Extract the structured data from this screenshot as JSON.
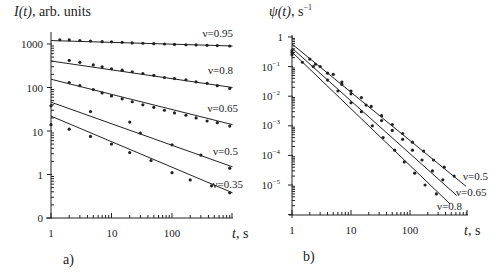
{
  "chart_data": [
    {
      "type": "line",
      "panel_label": "a)",
      "title": "",
      "ylabel": "I(t), arb. units",
      "xlabel": "t, s",
      "xscale": "log",
      "yscale": "log",
      "xlim": [
        1,
        1000
      ],
      "ylim": [
        0.1,
        2000
      ],
      "x_ticks": [
        1,
        10,
        100
      ],
      "x_tick_labels": [
        "1",
        "10",
        "100"
      ],
      "y_ticks": [
        1000,
        100,
        10,
        1,
        0.1
      ],
      "y_tick_labels": [
        "1000",
        "100",
        "10",
        "1",
        "0"
      ],
      "grid": false,
      "legend": "inline labels at right end of each line",
      "series": [
        {
          "name": "v=0.95",
          "label": "ν=0.95",
          "fit": {
            "t": [
              1,
              1000
            ],
            "y": [
              1200,
              900
            ]
          },
          "points": {
            "t": [
              1.4,
              2,
              3,
              4.5,
              7,
              10,
              15,
              22,
              33,
              50,
              75,
              110,
              170,
              250,
              380,
              560,
              900
            ],
            "y": [
              1250,
              1240,
              1200,
              1170,
              1130,
              1120,
              1090,
              1060,
              1040,
              1020,
              1000,
              980,
              960,
              950,
              930,
              920,
              900
            ]
          }
        },
        {
          "name": "v=0.8",
          "label": "ν=0.8",
          "fit": {
            "t": [
              1,
              1000
            ],
            "y": [
              406,
              100
            ]
          },
          "points": {
            "t": [
              2,
              3,
              5,
              7,
              10,
              15,
              22,
              33,
              50,
              75,
              110,
              170,
              250,
              380,
              560,
              900
            ],
            "y": [
              420,
              380,
              330,
              300,
              270,
              250,
              230,
              210,
              190,
              170,
              160,
              150,
              135,
              125,
              110,
              95
            ]
          }
        },
        {
          "name": "v=0.65",
          "label": "ν=0.65",
          "fit": {
            "t": [
              1,
              1000
            ],
            "y": [
              155,
              14
            ]
          },
          "points": {
            "t": [
              2,
              3,
              5,
              7,
              10,
              15,
              22,
              33,
              50,
              75,
              110,
              170,
              250,
              380,
              560,
              900
            ],
            "y": [
              130,
              110,
              90,
              75,
              64,
              55,
              47,
              40,
              35,
              30,
              26,
              23,
              20,
              17,
              15.5,
              13
            ]
          }
        },
        {
          "name": "v=0.5",
          "label": "ν=0.5",
          "fit": {
            "t": [
              1,
              1000
            ],
            "y": [
              46,
              1.5
            ]
          },
          "points": {
            "t": [
              1,
              4.5,
              20,
              30,
              100,
              300,
              900
            ],
            "y": [
              38,
              28,
              16,
              9,
              4.8,
              2.8,
              1.4
            ]
          }
        },
        {
          "name": "v=0.35",
          "label": "ν=0.35",
          "fit": {
            "t": [
              1,
              1000
            ],
            "y": [
              22,
              0.38
            ]
          },
          "points": {
            "t": [
              1,
              2,
              4.5,
              10,
              20,
              45,
              100,
              200,
              450,
              900
            ],
            "y": [
              14,
              11,
              7.5,
              5,
              3.2,
              2.1,
              1.1,
              0.75,
              0.55,
              0.38
            ]
          }
        }
      ]
    },
    {
      "type": "line",
      "panel_label": "b)",
      "title": "",
      "ylabel": "ψ(t), s⁻¹",
      "xlabel": "t, s",
      "xscale": "log",
      "yscale": "log",
      "xlim": [
        1,
        1000
      ],
      "ylim": [
        1e-06,
        1
      ],
      "x_ticks": [
        1,
        10,
        100
      ],
      "x_tick_labels": [
        "1",
        "10",
        "100"
      ],
      "y_ticks": [
        1,
        0.1,
        0.01,
        0.001,
        0.0001,
        1e-05
      ],
      "y_tick_labels": [
        "1",
        "10⁻¹",
        "10⁻²",
        "10⁻³",
        "10⁻⁴",
        "10⁻⁵"
      ],
      "grid": false,
      "legend": "inline labels at lower right end of each line",
      "series": [
        {
          "name": "v=0.5",
          "label": "ν=0.5",
          "fit": {
            "t": [
              1,
              890
            ],
            "y": [
              0.58,
              9e-06
            ]
          },
          "points": {
            "t": [
              1,
              2,
              3,
              5,
              7,
              10,
              15,
              22,
              33,
              50,
              75,
              110,
              170,
              250,
              380,
              560
            ],
            "y": [
              0.35,
              0.18,
              0.1,
              0.055,
              0.03,
              0.015,
              0.009,
              0.0045,
              0.0022,
              0.0011,
              0.00055,
              0.00028,
              0.00014,
              7e-05,
              4e-05,
              2e-05
            ]
          }
        },
        {
          "name": "v=0.65",
          "label": "ν=0.65",
          "fit": {
            "t": [
              1,
              620
            ],
            "y": [
              0.42,
              4.4e-06
            ]
          },
          "points": {
            "t": [
              1,
              2.5,
              4,
              7,
              10,
              18,
              33,
              50,
              75,
              110,
              160,
              240,
              360
            ],
            "y": [
              0.3,
              0.12,
              0.06,
              0.025,
              0.012,
              0.005,
              0.0015,
              0.0007,
              0.00035,
              0.00015,
              7e-05,
              3e-05,
              1.5e-05
            ]
          }
        },
        {
          "name": "v=0.8",
          "label": "ν=0.8",
          "fit": {
            "t": [
              1,
              475
            ],
            "y": [
              0.31,
              2.3e-06
            ]
          },
          "points": {
            "t": [
              1,
              1.5,
              2.3,
              4,
              6,
              10,
              15,
              23,
              35,
              55,
              80,
              120,
              180,
              280
            ],
            "y": [
              0.25,
              0.14,
              0.1,
              0.035,
              0.015,
              0.006,
              0.003,
              0.001,
              0.0004,
              0.00015,
              6e-05,
              2.5e-05,
              1e-05,
              5e-06
            ]
          }
        }
      ]
    }
  ],
  "panels": {
    "a": {
      "ylabel_main": "I(t)",
      "ylabel_rest": ", arb. units",
      "xlabel_t": "t",
      "xlabel_rest": ", s",
      "panel_label": "a)",
      "y_tick_labels": [
        "1000",
        "100",
        "10",
        "1",
        "0"
      ],
      "x_tick_labels": [
        "1",
        "10",
        "100"
      ],
      "series_labels": [
        "ν=0.95",
        "ν=0.8",
        "ν=0.65",
        "ν=0.5",
        "ν=0.35"
      ]
    },
    "b": {
      "ylabel_main": "ψ(t)",
      "ylabel_rest": ", s",
      "ylabel_sup": "−1",
      "xlabel_t": "t",
      "xlabel_rest": ", s",
      "panel_label": "b)",
      "y_tick_base": "10",
      "y_tick_labels": [
        "1",
        "10",
        "10",
        "10",
        "10",
        "10"
      ],
      "y_tick_exps": [
        "",
        "−1",
        "−2",
        "−3",
        "−4",
        "−5"
      ],
      "x_tick_labels": [
        "1",
        "10",
        "100"
      ],
      "series_labels": [
        "ν=0.5",
        "ν=0.65",
        "ν=0.8"
      ]
    }
  },
  "colors": {
    "ink": "#222222",
    "background": "#ffffff"
  }
}
